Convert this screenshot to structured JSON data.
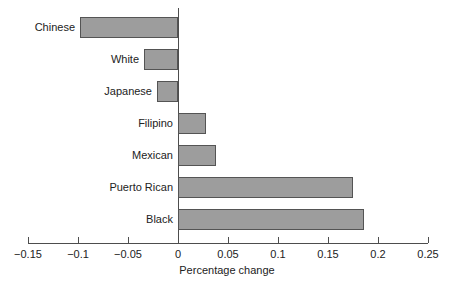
{
  "chart_data": {
    "type": "bar",
    "orientation": "horizontal",
    "title": "",
    "subtitle": "",
    "xlabel": "Percentage change",
    "ylabel": "",
    "categories": [
      "Chinese",
      "White",
      "Japanese",
      "Filipino",
      "Mexican",
      "Puerto Rican",
      "Black"
    ],
    "values": [
      -0.098,
      -0.034,
      -0.021,
      0.028,
      0.038,
      0.175,
      0.186
    ],
    "xlim": [
      -0.15,
      0.25
    ],
    "xticks": [
      -0.15,
      -0.1,
      -0.05,
      0,
      0.05,
      0.1,
      0.15,
      0.2,
      0.25
    ],
    "xtick_labels": [
      "−0.15",
      "−0.1",
      "−0.05",
      "0",
      "0.05",
      "0.1",
      "0.15",
      "0.2",
      "0.25"
    ],
    "grid": false,
    "legend": null,
    "legend_position": "none",
    "bar_fill_color": "#9d9d9d",
    "bar_border_color": "#545454",
    "axis_color": "#4d4d4d",
    "background_color": "#ffffff"
  }
}
